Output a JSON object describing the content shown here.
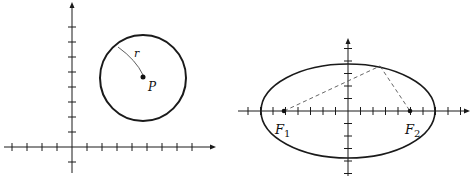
{
  "figures": [
    {
      "id": "circle",
      "description": "Circle with center P and radius r on coordinate axes",
      "labels": {
        "radius": "r",
        "center": "P"
      },
      "axes": {
        "x_ticks_left": 4,
        "x_ticks_right": 8,
        "y_ticks_up": 8,
        "y_ticks_down": 1
      },
      "circle": {
        "center": [
          5,
          4.6
        ],
        "radius": 2.9
      }
    },
    {
      "id": "ellipse",
      "description": "Ellipse with foci F1 and F2; dashed lines from foci to a point on the ellipse",
      "labels": {
        "focus1": "F",
        "focus1_sub": "1",
        "focus2": "F",
        "focus2_sub": "2"
      },
      "axes": {
        "x_ticks_left": 8,
        "x_ticks_right": 9,
        "y_ticks_up": 5,
        "y_ticks_down": 5
      },
      "ellipse": {
        "a": 7,
        "b": 3.8,
        "foci": [
          -5,
          5
        ],
        "point_on_ellipse": [
          2.6,
          3.5
        ]
      }
    }
  ],
  "colors": {
    "stroke": "#1a1a1a",
    "dash": "#555555"
  }
}
